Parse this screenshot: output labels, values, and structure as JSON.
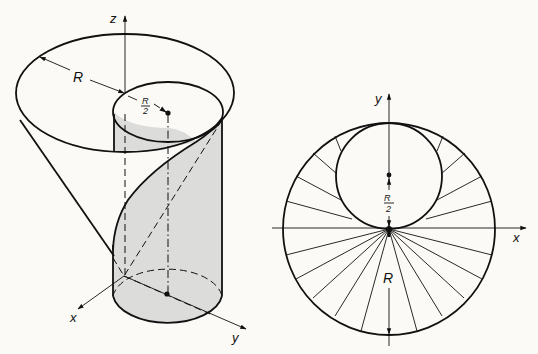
{
  "figure": {
    "background": "#fbfaf6",
    "stroke_color": "#111111",
    "shade_color": "#dcdcda",
    "left_panel": {
      "description": "Cone of radius R with inner cylinder of radius R/2 and helical cut",
      "axis_labels": {
        "z": "z",
        "x": "x",
        "y": "y"
      },
      "dimension_labels": {
        "R": "R",
        "half_R_num": "R",
        "half_R_den": "2"
      }
    },
    "right_panel": {
      "description": "Top view: outer circle radius R, inner circle radius R/2 tangent at origin, radial lines",
      "axis_labels": {
        "x": "x",
        "y": "y"
      },
      "dimension_labels": {
        "R": "R",
        "half_R_num": "R",
        "half_R_den": "2"
      },
      "radial_angles_below_deg": [
        15,
        30,
        45,
        60,
        75
      ],
      "radial_angles_above_deg": [
        15,
        30,
        45,
        60
      ]
    }
  }
}
